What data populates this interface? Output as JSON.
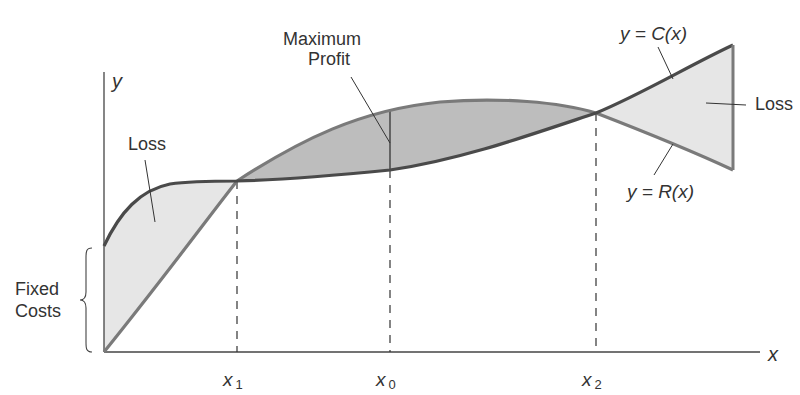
{
  "diagram": {
    "axes": {
      "y_label": "y",
      "x_label": "x"
    },
    "x_marks": [
      {
        "label": "x",
        "sub": "1",
        "x": 237
      },
      {
        "label": "x",
        "sub": "0",
        "x": 390
      },
      {
        "label": "x",
        "sub": "2",
        "x": 596
      }
    ],
    "annotations": {
      "loss_left": "Loss",
      "loss_right": "Loss",
      "max_profit_line1": "Maximum",
      "max_profit_line2": "Profit",
      "fixed_costs_line1": "Fixed",
      "fixed_costs_line2": "Costs",
      "cost_curve": "y = C(x)",
      "revenue_curve": "y = R(x)"
    },
    "colors": {
      "cost_curve": "#4a4a4a",
      "revenue_curve": "#7a7a7a",
      "loss_fill": "#e6e6e6",
      "profit_fill": "#bdbdbd",
      "axis": "#444444"
    }
  }
}
